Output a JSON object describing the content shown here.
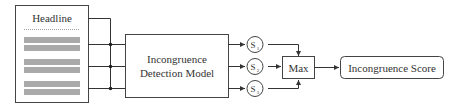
{
  "diagram": {
    "document": {
      "headline_label": "Headline",
      "body_bar_groups": 3
    },
    "model": {
      "line1": "Incongruence",
      "line2": "Detection Model"
    },
    "scores": [
      {
        "label": "S",
        "sub": "1"
      },
      {
        "label": "S",
        "sub": "2"
      },
      {
        "label": "S",
        "sub": "3"
      }
    ],
    "aggregator": {
      "label": "Max"
    },
    "output": {
      "label": "Incongruence Score"
    },
    "colors": {
      "stroke": "#333333",
      "bar": "#aaaaaa",
      "background": "#ffffff"
    }
  }
}
